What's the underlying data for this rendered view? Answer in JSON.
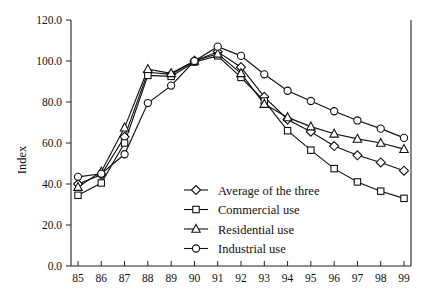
{
  "chart_data": {
    "type": "line",
    "title": "",
    "subtitle": "",
    "xlabel": "",
    "ylabel": "Index",
    "x": [
      "85",
      "86",
      "87",
      "88",
      "89",
      "90",
      "91",
      "92",
      "93",
      "94",
      "95",
      "96",
      "97",
      "98",
      "99"
    ],
    "xlim": [
      85,
      99
    ],
    "ylim": [
      0.0,
      120.0
    ],
    "ytick_labels": [
      "0.0",
      "20.0",
      "40.0",
      "60.0",
      "80.0",
      "100.0",
      "120.0"
    ],
    "ytick_values": [
      0,
      20,
      40,
      60,
      80,
      100,
      120
    ],
    "xtick_labels": [
      "85",
      "86",
      "87",
      "88",
      "89",
      "90",
      "91",
      "92",
      "93",
      "94",
      "95",
      "96",
      "97",
      "98",
      "99"
    ],
    "grid": false,
    "legend_position": "center-bottom-inside",
    "series": [
      {
        "name": "Average of the three",
        "marker": "diamond",
        "values": [
          40.0,
          44.5,
          63.0,
          94.5,
          93.5,
          100.0,
          104.5,
          97.0,
          82.5,
          71.5,
          65.5,
          58.5,
          54.0,
          50.5,
          46.5
        ]
      },
      {
        "name": "Commercial use",
        "marker": "square",
        "values": [
          34.5,
          40.5,
          60.0,
          93.0,
          92.5,
          99.5,
          102.5,
          92.0,
          80.5,
          66.0,
          56.5,
          47.5,
          41.0,
          36.5,
          33.0
        ]
      },
      {
        "name": "Residential use",
        "marker": "triangle",
        "values": [
          38.5,
          46.0,
          67.5,
          96.0,
          94.0,
          100.0,
          103.5,
          94.0,
          79.0,
          72.5,
          68.0,
          64.5,
          62.0,
          60.0,
          57.0
        ]
      },
      {
        "name": "Industrial use",
        "marker": "circle",
        "values": [
          43.5,
          45.0,
          54.5,
          79.5,
          88.0,
          100.0,
          107.0,
          102.5,
          93.5,
          85.5,
          80.5,
          75.5,
          71.0,
          67.0,
          62.5
        ]
      }
    ],
    "colors": {
      "line": "#111111",
      "marker_fill": "#ffffff",
      "marker_stroke": "#111111",
      "axis": "#222222",
      "background": "#ffffff"
    }
  },
  "legend": {
    "items": [
      {
        "label": "Average of the three",
        "marker": "diamond"
      },
      {
        "label": "Commercial use",
        "marker": "square"
      },
      {
        "label": "Residential use",
        "marker": "triangle"
      },
      {
        "label": "Industrial use",
        "marker": "circle"
      }
    ]
  }
}
